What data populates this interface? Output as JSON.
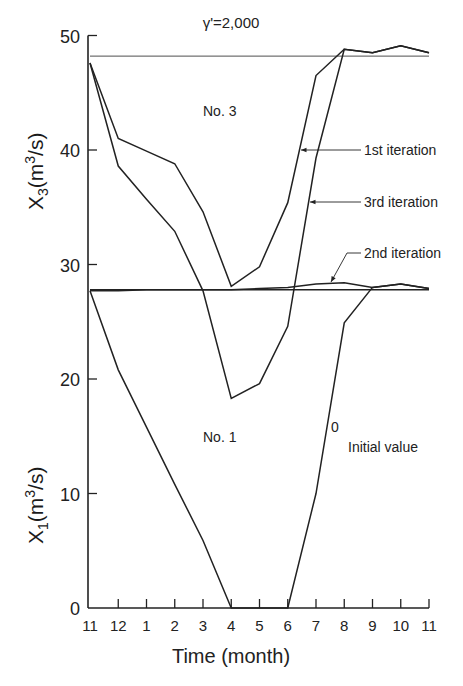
{
  "chart_data": {
    "type": "line",
    "title": "γ'=2,000",
    "xlabel": "Time (month)",
    "ylabel_upper": "X3(m3/s)",
    "ylabel_lower": "X1(m3/s)",
    "x_ticks": [
      "11",
      "12",
      "1",
      "2",
      "3",
      "4",
      "5",
      "6",
      "7",
      "8",
      "9",
      "10",
      "11"
    ],
    "y_ticks": [
      0,
      10,
      20,
      30,
      40,
      50
    ],
    "ylim": [
      0,
      50
    ],
    "grid": false,
    "annotations": [
      "No. 3",
      "No. 1",
      "1st iteration",
      "3rd iteration",
      "2nd iteration",
      "0",
      "Initial value"
    ],
    "reference_lines": [
      {
        "name": "No. 3 target",
        "y": 48.2
      },
      {
        "name": "No. 1 target",
        "y": 27.8
      }
    ],
    "categories": [
      "11",
      "12",
      "1",
      "2",
      "3",
      "4",
      "5",
      "6",
      "7",
      "8",
      "9",
      "10",
      "11"
    ],
    "series": [
      {
        "name": "1st iteration (No. 3)",
        "values": [
          47.6,
          41.0,
          39.9,
          38.8,
          34.6,
          28.1,
          29.8,
          35.4,
          46.5,
          48.8,
          48.5,
          49.1,
          48.5
        ]
      },
      {
        "name": "3rd iteration (No. 3)",
        "values": [
          47.6,
          38.6,
          35.7,
          32.9,
          27.7,
          18.3,
          19.6,
          24.6,
          39.3,
          48.8,
          48.5,
          49.1,
          48.5
        ]
      },
      {
        "name": "2nd iteration (No. 1)",
        "values": [
          27.7,
          27.7,
          27.8,
          27.8,
          27.8,
          27.8,
          27.9,
          28.0,
          28.3,
          28.4,
          28.0,
          28.3,
          27.9
        ]
      },
      {
        "name": "Initial value 0 (No. 1)",
        "values": [
          27.7,
          20.8,
          15.8,
          10.8,
          5.9,
          0,
          0,
          0,
          10.0,
          24.9,
          28.0,
          28.3,
          27.9
        ]
      }
    ]
  },
  "labels": {
    "title": "γ'=2,000",
    "xlabel": "Time (month)",
    "no3": "No. 3",
    "no1": "No. 1",
    "first_iter": "1st iteration",
    "third_iter": "3rd iteration",
    "second_iter": "2nd iteration",
    "zero": "0",
    "initial_value": "Initial value",
    "y_upper_main": "X",
    "y_upper_sub": "3",
    "y_upper_unit_a": "(m",
    "y_upper_sup": "3",
    "y_upper_unit_b": "/s)",
    "y_lower_main": "X",
    "y_lower_sub": "1",
    "y_lower_unit_a": "(m",
    "y_lower_sup": "3",
    "y_lower_unit_b": "/s)"
  },
  "style": {
    "line_color": "#222222",
    "background": "#ffffff"
  }
}
